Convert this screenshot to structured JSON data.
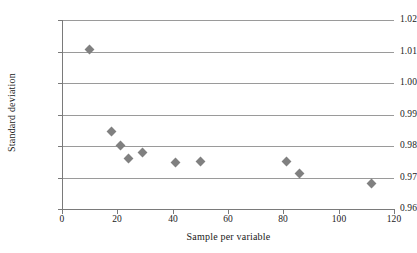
{
  "chart_data": {
    "type": "scatter",
    "title": "",
    "xlabel": "Sample per variable",
    "ylabel": "Standard deviation",
    "xlim": [
      0,
      120
    ],
    "ylim": [
      0.96,
      1.02
    ],
    "xticks": [
      "0",
      "20",
      "40",
      "60",
      "80",
      "100",
      "120"
    ],
    "xtick_values": [
      0,
      20,
      40,
      60,
      80,
      100,
      120
    ],
    "yticks": [
      "0.96",
      "0.97",
      "0.98",
      "0.99",
      "1.00",
      "1.01",
      "1.02"
    ],
    "ytick_values": [
      0.96,
      0.97,
      0.98,
      0.99,
      1.0,
      1.01,
      1.02
    ],
    "grid": "horizontal",
    "legend": "none",
    "marker": "diamond",
    "marker_color": "#808080",
    "axis_color": "#7a7a7a",
    "gridline_color": "#9a9a9a",
    "x": [
      10,
      18,
      21,
      24,
      29,
      41,
      50,
      81,
      86,
      112
    ],
    "y": [
      1.0105,
      0.9845,
      0.9801,
      0.976,
      0.9778,
      0.9748,
      0.9751,
      0.975,
      0.9714,
      0.968
    ],
    "points": [
      {
        "x": 10,
        "y": 1.0105
      },
      {
        "x": 18,
        "y": 0.9845
      },
      {
        "x": 21,
        "y": 0.9801
      },
      {
        "x": 24,
        "y": 0.976
      },
      {
        "x": 29,
        "y": 0.9778
      },
      {
        "x": 41,
        "y": 0.9748
      },
      {
        "x": 50,
        "y": 0.9751
      },
      {
        "x": 81,
        "y": 0.975
      },
      {
        "x": 86,
        "y": 0.9714
      },
      {
        "x": 112,
        "y": 0.968
      }
    ]
  }
}
